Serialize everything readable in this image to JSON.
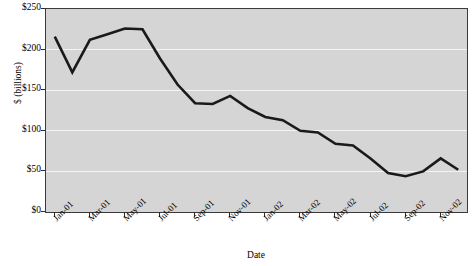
{
  "chart_data": {
    "type": "line",
    "title": "",
    "xlabel": "Date",
    "ylabel": "$ (billions)",
    "ylim": [
      0,
      250
    ],
    "ytick_values": [
      0,
      50,
      100,
      150,
      200,
      250
    ],
    "ytick_labels": [
      "$0",
      "$50",
      "$100",
      "$150",
      "$200",
      "$250"
    ],
    "grid": "horizontal",
    "legend": "none",
    "categories": [
      "Jan-01",
      "Feb-01",
      "Mar-01",
      "Apr-01",
      "May-01",
      "Jun-01",
      "Jul-01",
      "Aug-01",
      "Sep-01",
      "Oct-01",
      "Nov-01",
      "Dec-01",
      "Jan-02",
      "Feb-02",
      "Mar-02",
      "Apr-02",
      "May-02",
      "Jun-02",
      "Jul-02",
      "Aug-02",
      "Sep-02",
      "Oct-02",
      "Nov-02",
      "Dec-02"
    ],
    "xtick_labels": [
      "Jan-01",
      "Mar-01",
      "May-01",
      "Jul-01",
      "Sep-01",
      "Nov-01",
      "Jan-02",
      "Mar-02",
      "May-02",
      "Jul-02",
      "Sep-02",
      "Nov-02"
    ],
    "values": [
      216,
      172,
      212,
      219,
      226,
      225,
      189,
      157,
      134,
      133,
      143,
      128,
      117,
      113,
      100,
      98,
      84,
      82,
      66,
      48,
      44,
      50,
      66,
      52
    ],
    "line_color": "#1a1a1a",
    "plot_background": "#d5d5d5",
    "gridline_color": "#f4f4f4",
    "axis_color": "#2b2b2b"
  }
}
